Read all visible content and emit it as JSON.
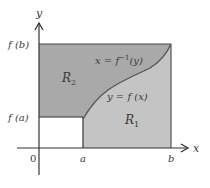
{
  "figure": {
    "colors": {
      "region_r2": "#a9a9a9",
      "region_r1": "#c4c4c4",
      "region_blank": "#ffffff",
      "axis": "#333333",
      "curve": "#555555"
    },
    "axes": {
      "x_label": "x",
      "y_label": "y",
      "origin_label": "0"
    },
    "ticks": {
      "x": [
        {
          "label": "a"
        },
        {
          "label": "b"
        }
      ],
      "y": [
        {
          "label": "f (a)"
        },
        {
          "label": "f (b)"
        }
      ]
    },
    "regions": {
      "r1": {
        "label": "R",
        "sub": "1"
      },
      "r2": {
        "label": "R",
        "sub": "2"
      }
    },
    "curve_labels": {
      "inverse": {
        "lhs": "x = f",
        "sup": "−1",
        "rhs": "(y)"
      },
      "function": "y = f (x)"
    }
  }
}
